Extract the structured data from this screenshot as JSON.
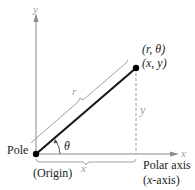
{
  "diagram": {
    "labels": {
      "y_axis": "y",
      "x_axis": "x",
      "polar_point": "(r, θ)",
      "rect_point": "(x, y)",
      "r_segment": "r",
      "y_segment": "y",
      "x_segment": "x",
      "angle": "θ",
      "pole": "Pole",
      "origin": "(Origin)",
      "polar_axis": "Polar axis",
      "polar_axis_alt": "(x-axis)"
    },
    "colors": {
      "main_line": "#1a1a1a",
      "axes": "#888888",
      "annotation": "#aaaaaa",
      "point": "#000000"
    },
    "points": {
      "origin": [
        36,
        154
      ],
      "point": [
        136,
        68
      ]
    }
  }
}
